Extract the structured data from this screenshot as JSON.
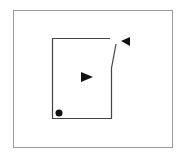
{
  "diagram": {
    "type": "floor-plan-schematic",
    "outer_frame": {
      "x": 13,
      "y": 10,
      "width": 159,
      "height": 137,
      "stroke": "#9a9a9a"
    },
    "room": {
      "left": 52,
      "top": 38,
      "right": 111,
      "bottom": 118,
      "top_wall_end_x": 110,
      "door_segment": {
        "x1": 111,
        "y1": 68,
        "x2": 116,
        "y2": 44
      },
      "stroke": "#444444"
    },
    "markers": [
      {
        "name": "triangle-right",
        "points": "81,72 81,82 93,77",
        "color": "#111111"
      },
      {
        "name": "triangle-left",
        "points": "130,37 121,41 130,46",
        "color": "#111111"
      },
      {
        "name": "dot",
        "cx": 59,
        "cy": 113,
        "r": 3.5,
        "color": "#111111"
      }
    ]
  }
}
